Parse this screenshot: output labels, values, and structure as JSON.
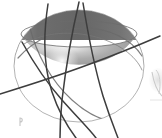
{
  "figure": {
    "title": "Shaded sphere with intersecting great-circle curves",
    "kind": "3d-sphere-geodesics-diagram",
    "background_color": "#ffffff",
    "canvas": {
      "width": 162,
      "height": 138
    }
  },
  "sphere": {
    "name": "main-sphere",
    "center_x": 79,
    "center_y": 66,
    "radius_x": 65,
    "radius_y": 56,
    "body_color": "#a9a9a9",
    "highlight_color": "#f2f2f2",
    "shadow_color": "#8c8c8c",
    "outline_color": "#9a9a9a",
    "highlight_x": 62,
    "highlight_y": 60
  },
  "cap_band": {
    "name": "rear-hemisphere-band",
    "label": "dark upper rim band",
    "color_dark": "#6f6f6f",
    "color_mid": "#7d7d7d",
    "top_y": 11,
    "bottom_y": 34
  },
  "equator": {
    "name": "equator-ellipse",
    "color": "#7a7a7a",
    "center_x": 79,
    "center_y": 34,
    "radius_x": 58,
    "radius_y": 13
  },
  "curves": [
    {
      "name": "geodesic-curve-1",
      "label": "great circle A",
      "color": "#3f3f3f",
      "width": 1.6,
      "path": "M 48 4 C 44 30, 42 62, 52 92 C 60 116, 70 130, 76 138"
    },
    {
      "name": "geodesic-curve-2",
      "label": "great circle B",
      "color": "#3f3f3f",
      "width": 1.6,
      "path": "M 79 2 C 72 32, 66 66, 62 100 C 60 120, 60 131, 60 138"
    },
    {
      "name": "geodesic-curve-3",
      "label": "great circle C",
      "color": "#3f3f3f",
      "width": 1.6,
      "path": "M 83 3 C 88 34, 94 66, 103 96 C 110 118, 115 130, 118 138"
    },
    {
      "name": "geodesic-curve-4",
      "label": "great circle D",
      "color": "#3f3f3f",
      "width": 1.6,
      "path": "M 0 94 C 26 86, 58 76, 90 64 C 120 53, 146 42, 160 36"
    },
    {
      "name": "geodesic-curve-5",
      "label": "great circle E",
      "color": "#3f3f3f",
      "width": 1.6,
      "path": "M 22 42 C 32 60, 46 82, 62 100 C 78 118, 90 130, 96 138"
    },
    {
      "name": "geodesic-curve-6",
      "label": "great circle F arc",
      "color": "#5c5c5c",
      "width": 1.3,
      "path": "M 18 58 C 34 40, 58 28, 84 28 C 110 28, 132 40, 142 56"
    },
    {
      "name": "geodesic-curve-7",
      "label": "great circle G arc",
      "color": "#5c5c5c",
      "width": 1.3,
      "path": "M 30 28 C 36 52, 50 80, 72 100 C 92 118, 112 124, 128 122"
    }
  ],
  "side_figure": {
    "name": "partial-adjacent-figure",
    "label": "faint partially cropped figure at right edge",
    "color": "#cfcfcf",
    "x": 148,
    "y": 70,
    "width": 14,
    "height": 40
  },
  "corner_mark": {
    "name": "bottom-left-mark",
    "label": "small faint mark",
    "color": "#b8b8b8",
    "x": 19,
    "y": 118,
    "width": 4,
    "height": 8
  }
}
